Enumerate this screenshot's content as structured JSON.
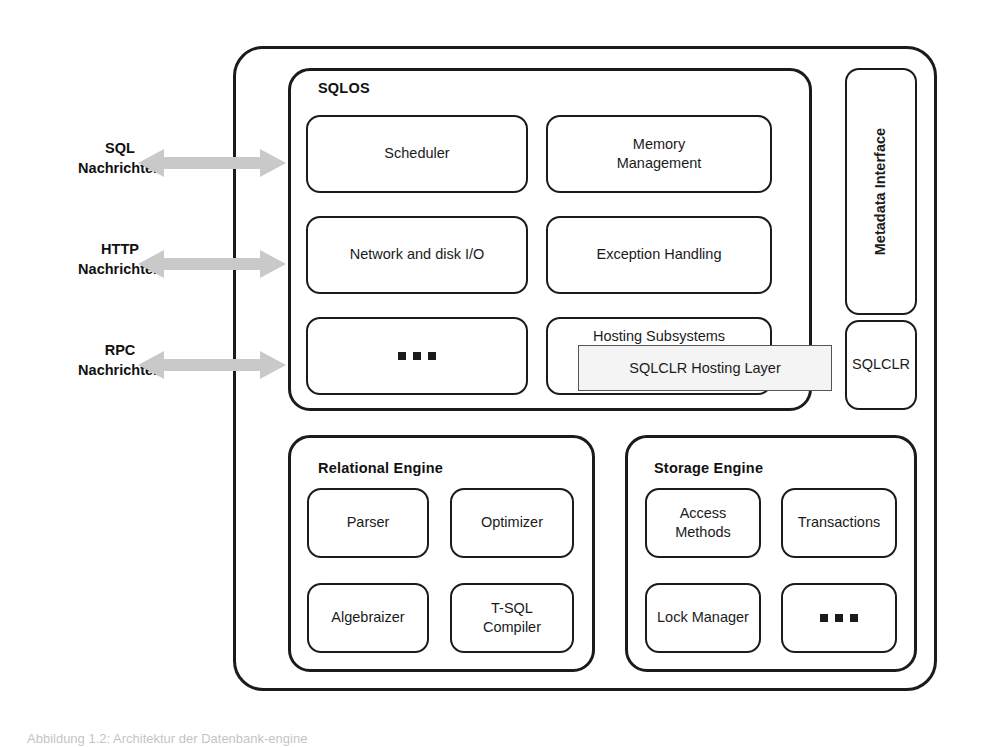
{
  "figure": {
    "caption": "Abbildung 1.2: Architektur der Datenbank-engine",
    "colors": {
      "stroke": "#1b1b1b",
      "frame": "#5a5a5a",
      "arrow": "#c9c9c9",
      "callout_fill": "#f4f4f4",
      "background": "#ffffff"
    }
  },
  "channels": [
    {
      "label": "SQL\nNachrichten",
      "icon": "double-arrow-icon"
    },
    {
      "label": "HTTP\nNachrichten",
      "icon": "double-arrow-icon"
    },
    {
      "label": "RPC\nNachrichten",
      "icon": "double-arrow-icon"
    }
  ],
  "sqlos": {
    "title": "SQLOS",
    "boxes": [
      {
        "label": "Scheduler"
      },
      {
        "label": "Memory\nManagement"
      },
      {
        "label": "Network and disk I/O"
      },
      {
        "label": "Exception Handling"
      },
      {
        "label": "",
        "ellipsis": true
      },
      {
        "label": "Hosting Subsystems"
      }
    ]
  },
  "callout": {
    "label": "SQLCLR Hosting Layer"
  },
  "right_column": [
    {
      "label": "Metadata Interface",
      "orientation": "vertical"
    },
    {
      "label": "SQLCLR",
      "orientation": "horizontal"
    }
  ],
  "relational_engine": {
    "title": "Relational Engine",
    "boxes": [
      {
        "label": "Parser"
      },
      {
        "label": "Optimizer"
      },
      {
        "label": "Algebraizer"
      },
      {
        "label": "T-SQL\nCompiler"
      }
    ]
  },
  "storage_engine": {
    "title": "Storage Engine",
    "boxes": [
      {
        "label": "Access\nMethods"
      },
      {
        "label": "Transactions"
      },
      {
        "label": "Lock Manager"
      },
      {
        "label": "",
        "ellipsis": true
      }
    ]
  }
}
